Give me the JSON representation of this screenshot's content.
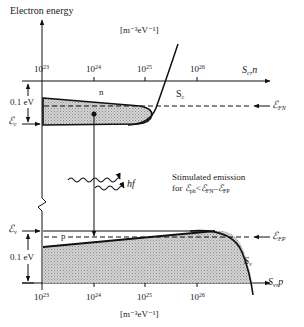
{
  "diagram": {
    "y_axis_label": "Electron energy",
    "top_axis": {
      "unit": "[m⁻³eV⁻¹]",
      "ticks": [
        "10",
        "10",
        "10",
        "10"
      ],
      "tick_exponents": [
        "23",
        "24",
        "25",
        "26"
      ],
      "axis_label": "S",
      "axis_label_sub": "c",
      "axis_label_suffix": ",n"
    },
    "bottom_axis": {
      "unit": "[m⁻³eV⁻¹]",
      "ticks": [
        "10",
        "10",
        "10",
        "10"
      ],
      "tick_exponents": [
        "23",
        "24",
        "25",
        "26"
      ],
      "axis_label": "S",
      "axis_label_sub": "v",
      "axis_label_suffix": ",p"
    },
    "conduction_band": {
      "energy_span_label": "0.1 eV",
      "edge_label": "ℰ",
      "edge_label_sub": "c",
      "carrier_label": "n",
      "dos_label": "S",
      "dos_label_sub": "c",
      "fermi_label": "ℰ",
      "fermi_label_sub": "FN"
    },
    "valence_band": {
      "energy_span_label": "0.1 eV",
      "edge_label": "ℰ",
      "edge_label_sub": "v",
      "carrier_label": "p",
      "dos_label": "S",
      "dos_label_sub": "v",
      "fermi_label": "ℰ",
      "fermi_label_sub": "FP"
    },
    "photon": {
      "label": "hf"
    },
    "annotation": {
      "line1": "Stimulated emission",
      "line2_prefix": "for ",
      "e_ph": "ℰ",
      "e_ph_sub": "ph",
      "lt": "<",
      "e_fn": "ℰ",
      "e_fn_sub": "FN",
      "minus": "–",
      "e_fp": "ℰ",
      "e_fp_sub": "FP"
    },
    "colors": {
      "line": "#111111",
      "fill": "#c8c8c8",
      "background": "#ffffff"
    }
  }
}
